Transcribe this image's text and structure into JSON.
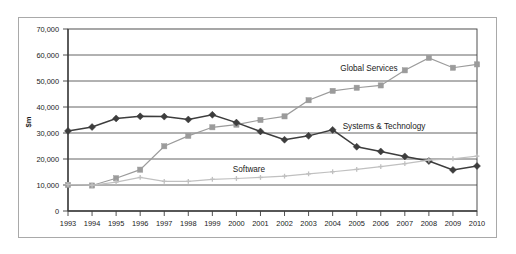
{
  "chart_data": {
    "type": "line",
    "title": "",
    "xlabel": "",
    "ylabel": "$m",
    "ylim": [
      0,
      70000
    ],
    "ytick_step": 10000,
    "grid": true,
    "legend_position": "inline-annotations",
    "yticks": [
      "0",
      "10,000",
      "20,000",
      "30,000",
      "40,000",
      "50,000",
      "60,000",
      "70,000"
    ],
    "categories": [
      "1993",
      "1994",
      "1995",
      "1996",
      "1997",
      "1998",
      "1999",
      "2000",
      "2001",
      "2002",
      "2003",
      "2004",
      "2005",
      "2006",
      "2007",
      "2008",
      "2009",
      "2010"
    ],
    "series": [
      {
        "name": "Global Services",
        "color": "#9b9b9b",
        "marker": "square",
        "values": [
          10000,
          9800,
          12600,
          15900,
          24900,
          28900,
          32200,
          33200,
          35000,
          36400,
          42600,
          46200,
          47400,
          48300,
          54100,
          58900,
          55100,
          56400
        ]
      },
      {
        "name": "Systems & Technology",
        "color": "#3d3d3d",
        "marker": "diamond",
        "values": [
          30800,
          32300,
          35600,
          36400,
          36300,
          35200,
          37000,
          34000,
          30600,
          27400,
          28900,
          31200,
          24700,
          22900,
          21000,
          19200,
          15800,
          17300
        ]
      },
      {
        "name": "Software",
        "color": "#c0c0c0",
        "marker": "cross",
        "values": [
          10200,
          9900,
          11100,
          12900,
          11400,
          11400,
          12200,
          12500,
          12900,
          13400,
          14300,
          15100,
          16000,
          17100,
          18200,
          19600,
          20100,
          21100
        ]
      }
    ],
    "annotations": [
      {
        "text": "Global Services",
        "x_px": 369,
        "y_px": 71
      },
      {
        "text": "Systems & Technology",
        "x_px": 384,
        "y_px": 129
      },
      {
        "text": "Software",
        "x_px": 249,
        "y_px": 172
      }
    ]
  }
}
